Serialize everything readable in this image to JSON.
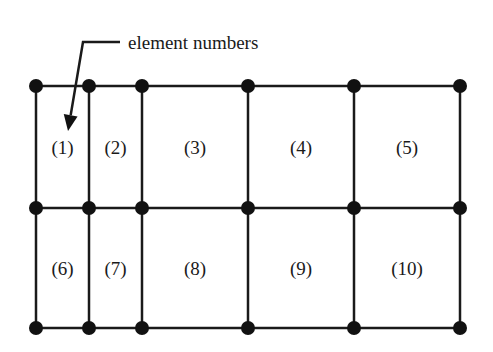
{
  "annotation": {
    "text": "element numbers",
    "text_x": 128,
    "text_y": 49,
    "leader": {
      "x1": 120,
      "y1": 42,
      "x2": 83,
      "y2": 42,
      "tip_x": 68,
      "tip_y": 131
    }
  },
  "mesh": {
    "x_nodes": [
      36,
      89,
      142,
      248,
      354,
      460
    ],
    "y_nodes": [
      86,
      208,
      328
    ],
    "line_color": "#1a1a1a",
    "node_color": "#111111",
    "node_radius": 7
  },
  "elements": [
    {
      "label": "(1)",
      "row": 0,
      "col": 0
    },
    {
      "label": "(2)",
      "row": 0,
      "col": 1
    },
    {
      "label": "(3)",
      "row": 0,
      "col": 2
    },
    {
      "label": "(4)",
      "row": 0,
      "col": 3
    },
    {
      "label": "(5)",
      "row": 0,
      "col": 4
    },
    {
      "label": "(6)",
      "row": 1,
      "col": 0
    },
    {
      "label": "(7)",
      "row": 1,
      "col": 1
    },
    {
      "label": "(8)",
      "row": 1,
      "col": 2
    },
    {
      "label": "(9)",
      "row": 1,
      "col": 3
    },
    {
      "label": "(10)",
      "row": 1,
      "col": 4
    }
  ]
}
